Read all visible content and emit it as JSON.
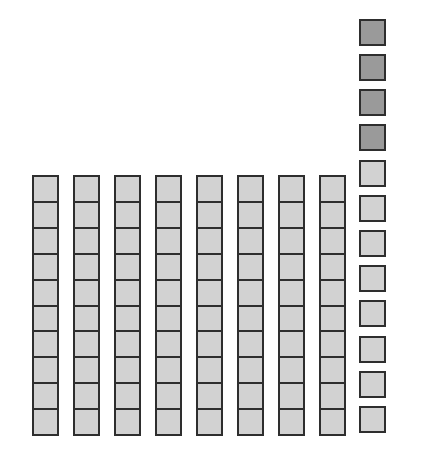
{
  "diagram": {
    "type": "base-ten-blocks",
    "tens": {
      "count": 8,
      "cells_per_rod": 10,
      "fill_color": "#d2d2d2",
      "x_positions": [
        32,
        73,
        114,
        155,
        196,
        237,
        278,
        319
      ],
      "top": 175,
      "height": 261
    },
    "ones": {
      "count": 12,
      "x": 359,
      "y_positions": [
        19,
        54,
        89,
        124,
        160,
        195,
        230,
        265,
        300,
        336,
        371,
        406
      ],
      "shaded_count": 4,
      "shaded_color": "#9a9a9a",
      "light_color": "#d2d2d2"
    },
    "border_color": "#2e2e2e"
  }
}
